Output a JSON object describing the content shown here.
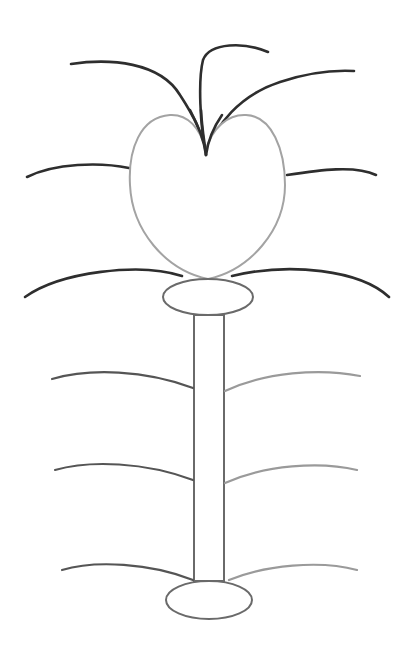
{
  "drawing": {
    "subject": "stylized plant with heart-shaped flower",
    "colors": {
      "background": "#ffffff",
      "dark_stroke": "#2e2e2e",
      "mid_stroke": "#555555",
      "light_stroke": "#9a9a9a",
      "outline_stroke": "#a3a3a3"
    },
    "parts": {
      "flower_head": "heart",
      "top_curves": 3,
      "side_whiskers": 4,
      "stem_leaves_left": 3,
      "stem_leaves_right": 3,
      "ellipses": 2
    }
  }
}
